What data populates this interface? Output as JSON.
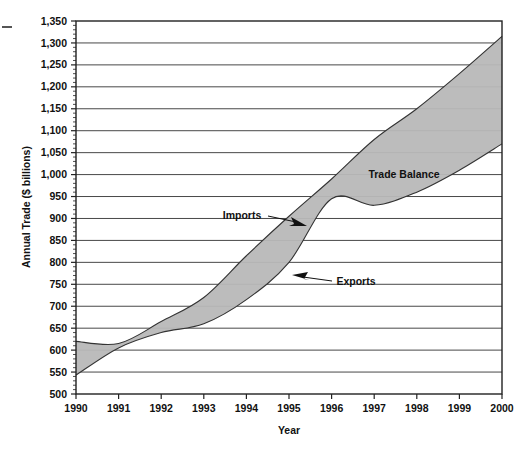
{
  "chart_data": {
    "type": "area",
    "title": "",
    "subtitle": "",
    "xlabel": "Year",
    "ylabel": "Annual Trade ($ billions)",
    "xlim": [
      1990,
      2000
    ],
    "ylim": [
      500,
      1350
    ],
    "ytick_step": 50,
    "grid": true,
    "legend_position": "inline-annotations",
    "x": [
      1990,
      1991,
      1992,
      1993,
      1994,
      1995,
      1996,
      1997,
      1998,
      1999,
      2000
    ],
    "xtick_labels": [
      "1990",
      "1991",
      "1992",
      "1993",
      "1994",
      "1995",
      "1996",
      "1997",
      "1998",
      "1999",
      "2000"
    ],
    "ytick_labels": [
      "500",
      "550",
      "600",
      "650",
      "700",
      "750",
      "800",
      "850",
      "900",
      "950",
      "1,000",
      "1,050",
      "1,100",
      "1,150",
      "1,200",
      "1,250",
      "1,300",
      "1,350"
    ],
    "ytick_values": [
      500,
      550,
      600,
      650,
      700,
      750,
      800,
      850,
      900,
      950,
      1000,
      1050,
      1100,
      1150,
      1200,
      1250,
      1300,
      1350
    ],
    "series": [
      {
        "name": "Imports",
        "values": [
          620,
          615,
          665,
          720,
          815,
          905,
          990,
          1080,
          1150,
          1230,
          1315
        ],
        "color": "#222222"
      },
      {
        "name": "Exports",
        "values": [
          543,
          605,
          640,
          660,
          715,
          800,
          945,
          930,
          960,
          1010,
          1070
        ],
        "color": "#222222"
      }
    ],
    "fill": {
      "name": "Trade Balance",
      "color": "#b8b8b8"
    },
    "annotations": [
      {
        "text": "Trade Balance",
        "x": 1998,
        "y": 1040
      },
      {
        "text": "Imports",
        "x": 1994.2,
        "y": 940
      },
      {
        "text": "Exports",
        "x": 1996.5,
        "y": 800
      }
    ]
  },
  "axis": {
    "y_title": "Annual Trade ($ billions)",
    "x_title": "Year"
  },
  "labels": {
    "trade_balance": "Trade Balance",
    "imports": "Imports",
    "exports": "Exports"
  }
}
